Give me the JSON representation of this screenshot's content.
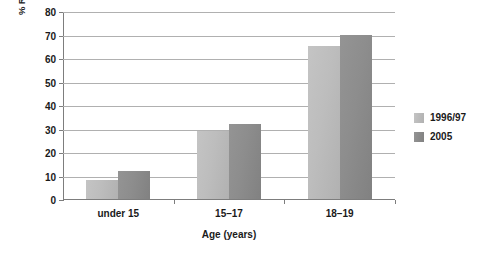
{
  "chart_data": {
    "type": "bar",
    "title": "",
    "categories": [
      "under 15",
      "15–17",
      "18–19"
    ],
    "series": [
      {
        "name": "1996/97",
        "values": [
          8,
          29,
          65
        ],
        "color": "#bdbdbd"
      },
      {
        "name": "2005",
        "values": [
          12,
          32,
          70
        ],
        "color": "#8d8d8d"
      }
    ],
    "xlabel": "Age (years)",
    "ylabel": "% Reporting First Sexual Intercourse",
    "ylim": [
      0,
      80
    ],
    "ytick_step": 10,
    "yticks": [
      "0",
      "10",
      "20",
      "30",
      "40",
      "50",
      "60",
      "70",
      "80"
    ],
    "grid": true,
    "legend_position": "right"
  },
  "legend": {
    "items": [
      {
        "label": "1996/97"
      },
      {
        "label": "2005"
      }
    ]
  }
}
